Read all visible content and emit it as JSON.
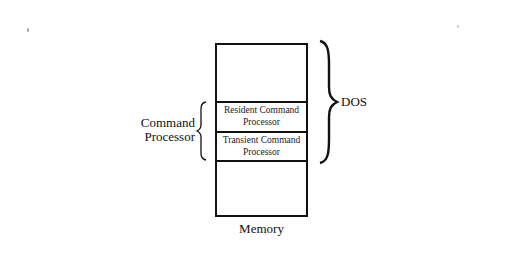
{
  "diagram": {
    "memory_block": {
      "label": "Memory",
      "cells": [
        {
          "id": "top",
          "text": ""
        },
        {
          "id": "resident",
          "line1": "Resident Command",
          "line2": "Processor"
        },
        {
          "id": "transient",
          "line1": "Transient Command",
          "line2": "Processor"
        },
        {
          "id": "bottom",
          "text": ""
        }
      ]
    },
    "left_brace": {
      "line1": "Command",
      "line2": "Processor"
    },
    "right_brace": {
      "label": "DOS"
    },
    "colors": {
      "line": "#111111",
      "background": "#ffffff"
    }
  }
}
